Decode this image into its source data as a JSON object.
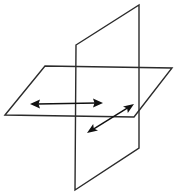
{
  "figure": {
    "background_color": "#ffffff",
    "width": 176,
    "height": 195,
    "line_color": "#2b2b2b",
    "arrow_color": "#111111",
    "shapes": {
      "horizontal_plane": {
        "name": "horizontal-plane",
        "type": "parallelogram",
        "points": "5,115 45,66 172,68 134,117",
        "stroke": "#2b2b2b",
        "stroke_width": 1.4
      },
      "vertical_plane": {
        "name": "vertical-plane",
        "type": "parallelogram",
        "points": "76,45 139,5 139,148 75,190",
        "stroke": "#2b2b2b",
        "stroke_width": 1.4
      }
    },
    "arrows": {
      "horizontal_arrow": {
        "name": "horizontal-double-arrow",
        "label": "",
        "x1": 30,
        "y1": 104,
        "x2": 103,
        "y2": 103,
        "double_headed": true,
        "color": "#111111"
      },
      "diagonal_arrow": {
        "name": "diagonal-double-arrow",
        "label": "",
        "x1": 87,
        "y1": 133,
        "x2": 134,
        "y2": 104,
        "double_headed": true,
        "color": "#111111"
      }
    }
  }
}
